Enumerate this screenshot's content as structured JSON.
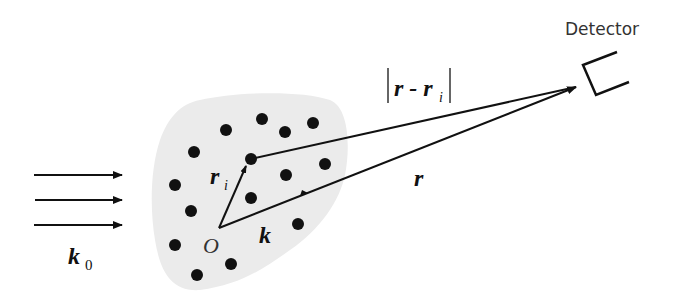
{
  "diagram": {
    "type": "scattering-geometry",
    "labels": {
      "detector": "Detector",
      "incident_wavevector": "k",
      "incident_wavevector_sub": "0",
      "scattered_wavevector": "k",
      "origin": "O",
      "position_vector_i": "r",
      "position_vector_i_sub": "i",
      "detector_vector": "r",
      "distance_label_main": "r - r",
      "distance_label_sub": "i"
    },
    "colors": {
      "blob": "#ebebeb",
      "ink": "#111111",
      "text": "#222222",
      "background": "#ffffff"
    },
    "scatterers": [
      [
        262,
        119
      ],
      [
        313,
        123
      ],
      [
        226,
        130
      ],
      [
        285,
        132
      ],
      [
        194,
        152
      ],
      [
        251,
        159
      ],
      [
        325,
        164
      ],
      [
        286,
        175
      ],
      [
        175,
        185
      ],
      [
        251,
        198
      ],
      [
        191,
        211
      ],
      [
        298,
        224
      ],
      [
        175,
        245
      ],
      [
        231,
        264
      ],
      [
        197,
        275
      ]
    ]
  }
}
